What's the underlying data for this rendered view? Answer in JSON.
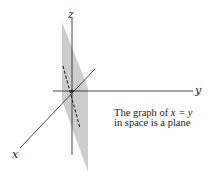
{
  "figure": {
    "axes": {
      "x_label": "x",
      "y_label": "y",
      "z_label": "z"
    },
    "caption": {
      "line1_prefix": "The graph of ",
      "line1_equation": "x = y",
      "line2": "in space is a plane"
    },
    "colors": {
      "plane": "#c8c8c8",
      "axes": "#333333",
      "trace": "#222222"
    }
  }
}
